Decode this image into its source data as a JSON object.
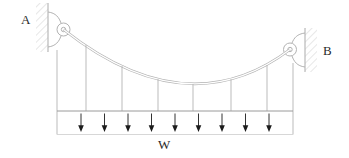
{
  "diagram": {
    "type": "suspension-cable-with-uniform-load",
    "labels": {
      "support_left": "A",
      "support_right": "B",
      "load": "W"
    },
    "counts": {
      "hanger_lines": 8,
      "load_arrows": 9
    },
    "colors": {
      "background": "#ffffff",
      "linework": "#b3b3b3",
      "structure_line": "#9a9a9a",
      "hatch": "#cfcfcf",
      "arrow": "#1c1c1c",
      "label_text": "#2a2a2a"
    }
  }
}
